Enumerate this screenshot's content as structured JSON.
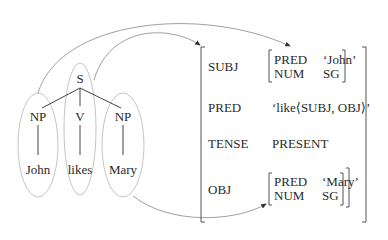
{
  "c_structure": {
    "root": "S",
    "children": [
      {
        "label": "NP",
        "word": "John"
      },
      {
        "label": "V",
        "word": "likes"
      },
      {
        "label": "NP",
        "word": "Mary"
      }
    ]
  },
  "f_structure": {
    "rows": [
      {
        "attr": "SUBJ",
        "value": {
          "rows": [
            {
              "attr": "PRED",
              "value": "‘John’"
            },
            {
              "attr": "NUM",
              "value": "SG"
            }
          ]
        }
      },
      {
        "attr": "PRED",
        "value": "‘like⟨SUBJ, OBJ⟩’"
      },
      {
        "attr": "TENSE",
        "value": "PRESENT"
      },
      {
        "attr": "OBJ",
        "value": {
          "rows": [
            {
              "attr": "PRED",
              "value": "‘Mary’"
            },
            {
              "attr": "NUM",
              "value": "SG"
            }
          ]
        }
      }
    ]
  },
  "mappings": [
    {
      "from": "NP (John)",
      "to": "SUBJ f-structure"
    },
    {
      "from": "S",
      "to": "outer f-structure"
    },
    {
      "from": "NP (Mary)",
      "to": "OBJ f-structure"
    }
  ],
  "colors": {
    "text": "#2a2a2a",
    "tree_lines": "#444444",
    "ellipses": "#b0b0b0",
    "arrows": "#888888"
  }
}
